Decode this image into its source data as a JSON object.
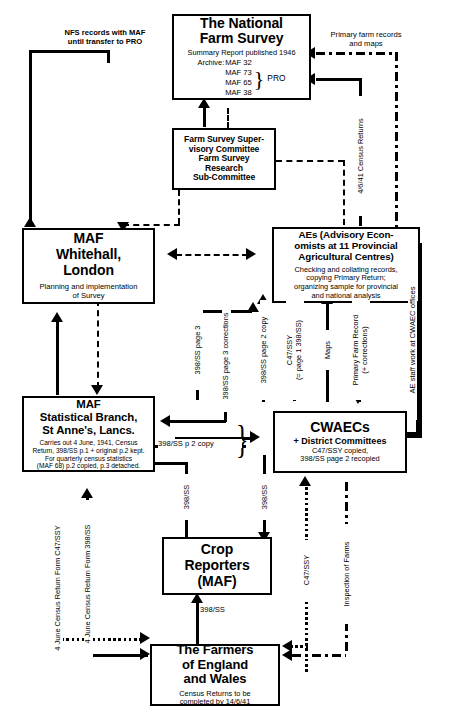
{
  "diagram": {
    "boxes": {
      "nfs": {
        "title": "The National\nFarm Survey",
        "line1": "Summary Report published 1946",
        "line2": "Archive:",
        "maf": [
          "MAF 32",
          "MAF 73",
          "MAF 65",
          "MAF 38"
        ],
        "brace_label": "PRO"
      },
      "fssc": {
        "title": "Farm Survey Super-\nvisory Committee\nFarm Survey\nResearch\nSub-Committee"
      },
      "maf_whitehall": {
        "title": "MAF\nWhitehall,\nLondon",
        "sub": "Planning and implementation\nof Survey"
      },
      "aes": {
        "title": "AEs (Advisory Econ-\nomists at 11 Provincial\nAgricultural Centres)",
        "sub": "Checking and collating records,\ncopying Primary Return;\norganizing sample for provincial\nand national analysis"
      },
      "maf_stat": {
        "title": "MAF\nStatistical Branch,\nSt Anne's, Lancs.",
        "sub": "Carries out 4 June, 1941, Census\nReturn, 398/SS p.1 + original p.2 kept.\nFor quarterly census statistics\n(MAF 68) p.2 copied, p.3 detached."
      },
      "cwaecs": {
        "title": "CWAECs",
        "subtitle": "+ District Committees",
        "sub": "C47/SSY  copied,\n398/SS page 2 recopied"
      },
      "crop": {
        "title": "Crop\nReporters\n(MAF)"
      },
      "farmers": {
        "title": "The Farmers\nof England\nand Wales",
        "sub": "Census Returns to be\ncompleted by 14/6/41"
      }
    },
    "edge_labels": {
      "nfs_records": "NFS records with MAF\nuntil transfer to PRO",
      "primary_farm_records": "Primary farm records\nand maps",
      "census_returns_4641": "4/6/41 Census Returns",
      "page3": "398/SS page 3",
      "page3_corrections": "398/SS page 3 corrections",
      "page2_copy_v": "398/SS page 2 copy",
      "c47ssy_page1": "C47/SSY\n(= page 1 398/SS)",
      "maps": "Maps",
      "primary_farm_record": "Primary Farm Record\n(+ corrections)",
      "ae_staff": "AE staff work at CWAEC offices",
      "p2copy": "398/SS p 2 copy",
      "p398ss_a": "398/SS",
      "p398ss_b": "398/SS",
      "p398ss_c": "398/SS",
      "c47ssy_up": "C47/SSY",
      "inspection": "Inspection of Farms",
      "return_398ss": "4 June Census Return Form 398/SS",
      "return_c47ssy": "4 June Census Return Form C47/SSY"
    }
  }
}
